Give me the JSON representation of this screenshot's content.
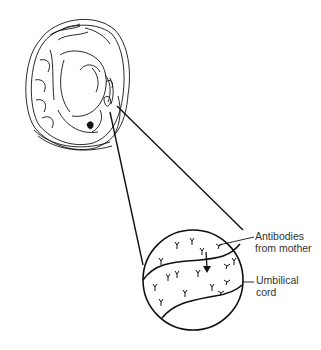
{
  "figure": {
    "type": "illustration",
    "colors": {
      "ink": "#111111",
      "label_text": "#333333",
      "background": "#ffffff"
    }
  },
  "labels": {
    "antibodies": {
      "line1": "Antibodies",
      "line2": "from mother"
    },
    "umbilical_cord": {
      "line1": "Umbilical",
      "line2": "cord"
    }
  },
  "elements": {
    "fetus": {
      "center": [
        76,
        82
      ],
      "approx_bounds": [
        25,
        15,
        128,
        150
      ]
    },
    "magnifier_circle": {
      "center": [
        193,
        280
      ],
      "radius": 50
    },
    "zoom_lines": [
      [
        [
          117,
          106
        ],
        [
          243,
          230
        ]
      ],
      [
        [
          110,
          112
        ],
        [
          143,
          265
        ]
      ]
    ],
    "antibody_count": 16,
    "arrow": {
      "from": [
        205,
        252
      ],
      "to": [
        207,
        272
      ]
    }
  }
}
